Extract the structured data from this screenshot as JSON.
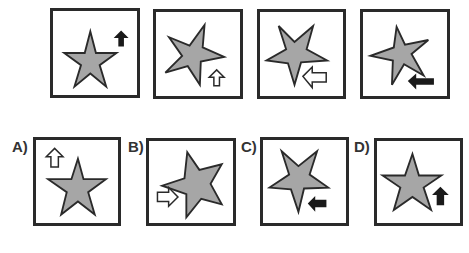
{
  "puzzle": {
    "sequence": [
      {
        "star_rotation": 0,
        "arrow": "up",
        "arrow_fill": "black",
        "arrow_pos": "top-right"
      },
      {
        "star_rotation": 18,
        "arrow": "up",
        "arrow_fill": "white",
        "arrow_pos": "bottom-right"
      },
      {
        "star_rotation": 36,
        "arrow": "left",
        "arrow_fill": "white",
        "arrow_pos": "bottom-right"
      },
      {
        "star_rotation": 54,
        "arrow": "left",
        "arrow_fill": "black",
        "arrow_pos": "bottom-right"
      }
    ],
    "options": [
      {
        "label": "A)",
        "star_rotation": 0,
        "arrow": "up",
        "arrow_fill": "white",
        "arrow_pos": "top-left"
      },
      {
        "label": "B)",
        "star_rotation": 18,
        "arrow": "right",
        "arrow_fill": "white",
        "arrow_pos": "bottom-left"
      },
      {
        "label": "C)",
        "star_rotation": 36,
        "arrow": "left",
        "arrow_fill": "black",
        "arrow_pos": "bottom-right"
      },
      {
        "label": "D)",
        "star_rotation": 0,
        "arrow": "up",
        "arrow_fill": "black",
        "arrow_pos": "bottom-right"
      }
    ],
    "colors": {
      "star_fill": "#a6a6a6",
      "outline": "#2a2a2a"
    }
  }
}
